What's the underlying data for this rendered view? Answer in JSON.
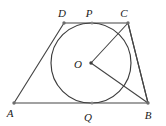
{
  "figure": {
    "background_color": "#ffffff",
    "line_color": "#454545",
    "label_color": "#1a1a1a",
    "labels": {
      "a": "A",
      "b": "B",
      "c": "C",
      "d": "D",
      "o": "O",
      "p": "P",
      "q": "Q"
    },
    "label_positions": {
      "a": {
        "x": 10,
        "y": 117
      },
      "b": {
        "x": 148,
        "y": 119
      },
      "c": {
        "x": 124,
        "y": 17
      },
      "d": {
        "x": 62,
        "y": 17
      },
      "o": {
        "x": 78,
        "y": 68
      },
      "p": {
        "x": 89,
        "y": 17
      },
      "q": {
        "x": 88,
        "y": 121
      }
    },
    "points": {
      "a": {
        "x": 14,
        "y": 103
      },
      "b": {
        "x": 148,
        "y": 103
      },
      "c": {
        "x": 128,
        "y": 23
      },
      "d": {
        "x": 64,
        "y": 23
      },
      "o": {
        "x": 91,
        "y": 63
      },
      "p": {
        "x": 92,
        "y": 23
      },
      "q": {
        "x": 92,
        "y": 103
      }
    },
    "circle": {
      "cx": 91,
      "cy": 63,
      "r": 40
    },
    "edges": [
      {
        "name": "side-ab",
        "from": "a",
        "to": "b"
      },
      {
        "name": "side-bc",
        "from": "b",
        "to": "c"
      },
      {
        "name": "side-cd",
        "from": "c",
        "to": "d"
      },
      {
        "name": "side-da",
        "from": "d",
        "to": "a"
      }
    ],
    "chords": [
      {
        "name": "radius-oc",
        "from": "o",
        "to": "c"
      },
      {
        "name": "radius-ob",
        "from": "o",
        "to": "b"
      },
      {
        "name": "segment-cb-inner",
        "from": "c",
        "to": "b"
      }
    ]
  }
}
